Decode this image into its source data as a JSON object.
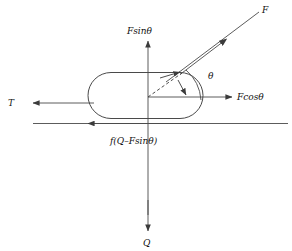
{
  "figure": {
    "colors": {
      "stroke": "#4a4a4a",
      "label": "#111111",
      "background": "#ffffff"
    },
    "body": {
      "shape": "capsule",
      "name": "capsule-body"
    },
    "labels": {
      "force_F": "F",
      "force_component_vertical": "Fsinθ",
      "force_component_horizontal": "Fcosθ",
      "tension_T": "T",
      "friction": "f(Q–Fsinθ)",
      "load_Q": "Q",
      "angle": "θ"
    },
    "vectors": [
      {
        "name": "force-F",
        "label": "F",
        "direction": "up-right",
        "origin": "contact-point",
        "arrow": "midpoint"
      },
      {
        "name": "force-Fsin-theta",
        "label": "Fsinθ",
        "direction": "up",
        "origin": "center",
        "arrow": "head"
      },
      {
        "name": "force-Fcos-theta",
        "label": "Fcosθ",
        "direction": "right",
        "origin": "center",
        "arrow": "head"
      },
      {
        "name": "tension-T",
        "label": "T",
        "direction": "left",
        "origin": "body-left-edge",
        "arrow": "head"
      },
      {
        "name": "friction-force",
        "label": "f(Q–Fsinθ)",
        "direction": "left",
        "origin": "ground-line",
        "arrow": "head"
      },
      {
        "name": "load-Q",
        "label": "Q",
        "direction": "down",
        "origin": "center",
        "arrow": "head"
      }
    ],
    "guides": [
      {
        "name": "dashed-resultant-guide",
        "style": "dashed"
      },
      {
        "name": "angle-arc",
        "style": "solid-arc",
        "arrows": "both-ends"
      },
      {
        "name": "ground-line",
        "style": "solid"
      }
    ]
  }
}
